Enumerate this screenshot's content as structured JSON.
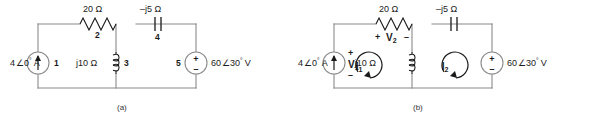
{
  "figure": {
    "line_color": "#8a8a8a",
    "text_color": "#1a1a1a",
    "background": "#ffffff"
  },
  "panels": [
    {
      "id": "a",
      "caption": "(a)",
      "source_current": {
        "magnitude": "4",
        "angle_symbol": "∠",
        "angle": "0",
        "degree": "°",
        "unit": "A",
        "icon": "current-source-up-arrow"
      },
      "source_voltage": {
        "magnitude": "60",
        "angle_symbol": "∠",
        "angle": "30",
        "degree": "°",
        "unit": "V",
        "plus": "+",
        "minus": "–",
        "icon": "voltage-source-plus-minus"
      },
      "components": [
        {
          "name": "resistor-20-ohm",
          "label": "20 Ω",
          "node": "2",
          "icon": "resistor-zigzag"
        },
        {
          "name": "inductor-j10-ohm",
          "label": "j10 Ω",
          "node": "3",
          "icon": "inductor-coil"
        },
        {
          "name": "capacitor-neg-j5-ohm",
          "label": "–j5 Ω",
          "node": "4",
          "icon": "capacitor-plates"
        }
      ],
      "nodes": [
        "1",
        "2",
        "3",
        "4",
        "5"
      ]
    },
    {
      "id": "b",
      "caption": "(b)",
      "source_current": {
        "magnitude": "4",
        "angle_symbol": "∠",
        "angle": "0",
        "degree": "°",
        "unit": "A",
        "icon": "current-source-up-arrow"
      },
      "source_voltage": {
        "magnitude": "60",
        "angle_symbol": "∠",
        "angle": "30",
        "degree": "°",
        "unit": "V",
        "plus": "+",
        "minus": "–",
        "icon": "voltage-source-plus-minus"
      },
      "components": [
        {
          "name": "resistor-20-ohm",
          "label": "20 Ω",
          "icon": "resistor-zigzag"
        },
        {
          "name": "inductor-j10-ohm",
          "label": "j10 Ω",
          "icon": "inductor-coil"
        },
        {
          "name": "capacitor-neg-j5-ohm",
          "label": "–j5 Ω",
          "icon": "capacitor-plates"
        }
      ],
      "voltages": [
        {
          "name": "V1",
          "base": "V",
          "sub": "1",
          "plus": "+",
          "minus": "–",
          "orientation": "vertical"
        },
        {
          "name": "V2",
          "base": "V",
          "sub": "2",
          "plus": "+",
          "minus": "–",
          "orientation": "horizontal"
        }
      ],
      "mesh_currents": [
        {
          "name": "I1",
          "base": "I",
          "sub": "1",
          "direction": "clockwise"
        },
        {
          "name": "I2",
          "base": "I",
          "sub": "2",
          "direction": "clockwise"
        }
      ]
    }
  ]
}
